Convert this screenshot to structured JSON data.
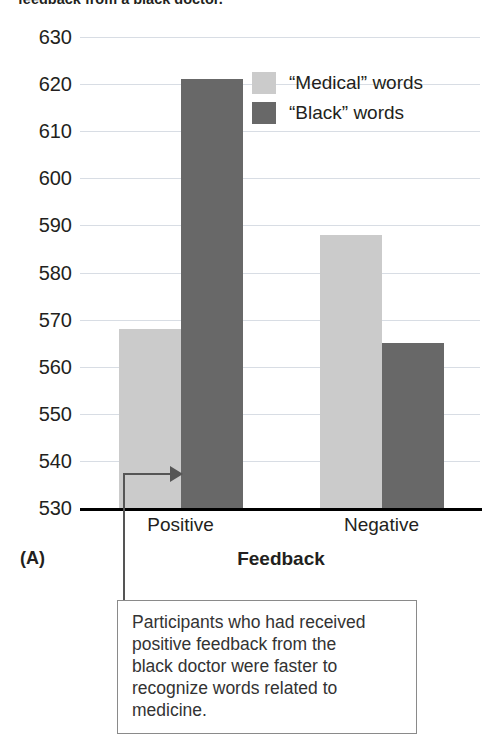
{
  "top_caption": "feedback from a black doctor.",
  "panel_label": "(A)",
  "legend": {
    "items": [
      {
        "label": "“Medical” words",
        "color": "#cbcbcb",
        "swatch": "light-gray-swatch"
      },
      {
        "label": "“Black” words",
        "color": "#686868",
        "swatch": "dark-gray-swatch"
      }
    ]
  },
  "callout": {
    "lines": [
      "Participants who had received",
      "positive feedback from the",
      "black doctor were faster to",
      "recognize words related to",
      "medicine."
    ]
  },
  "annotation": {
    "connector": "elbow-connector-with-arrow",
    "points_to": "positive-medical-bar"
  },
  "chart_data": {
    "type": "bar",
    "title": "",
    "xlabel": "Feedback",
    "ylabel": "",
    "categories": [
      "Positive",
      "Negative"
    ],
    "series": [
      {
        "name": "“Medical” words",
        "color": "#cbcbcb",
        "values": [
          568,
          588
        ]
      },
      {
        "name": "“Black” words",
        "color": "#686868",
        "values": [
          621,
          565
        ]
      }
    ],
    "ylim": [
      530,
      630
    ],
    "ytick_step": 10,
    "yticks": [
      630,
      620,
      610,
      600,
      590,
      580,
      570,
      560,
      550,
      540,
      530
    ],
    "grid": true,
    "legend_position": "top-right"
  }
}
